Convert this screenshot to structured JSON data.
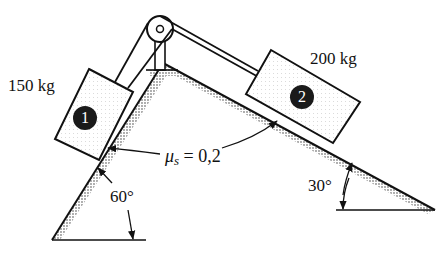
{
  "diagram": {
    "block1": {
      "number": "1",
      "mass_label": "150 kg",
      "incline_angle": "60°"
    },
    "block2": {
      "number": "2",
      "mass_label": "200 kg",
      "incline_angle": "30°"
    },
    "friction": {
      "symbol": "μ",
      "subscript": "s",
      "value": "= 0,2"
    },
    "colors": {
      "ink": "#111111",
      "shade": "#bdbdbd",
      "badge": "#1a1a1a"
    }
  }
}
